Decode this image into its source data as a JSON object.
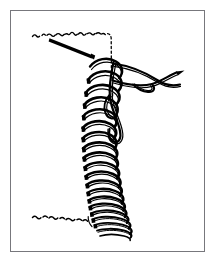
{
  "figure": {
    "style": "black ink line art on white",
    "colors": {
      "ink": "#000000",
      "background": "#ffffff",
      "frame_border": "#77777c"
    },
    "frame": {
      "x": 10,
      "y": 10,
      "width": 195,
      "height": 242,
      "border_width": 1
    },
    "parts": [
      {
        "name": "rope-body",
        "label": "vertical rope shaft"
      },
      {
        "name": "whipping-coils",
        "label": "coiled whipping turns"
      },
      {
        "name": "working-end-loop",
        "label": "working end loop"
      },
      {
        "name": "crossed-tails",
        "label": "crossed tail strands"
      },
      {
        "name": "tucked-end",
        "label": "tucked standing end"
      },
      {
        "name": "rope-edge-top",
        "label": "frayed top edge of rope"
      },
      {
        "name": "rope-edge-bottom",
        "label": "frayed bottom edge of rope"
      }
    ]
  }
}
